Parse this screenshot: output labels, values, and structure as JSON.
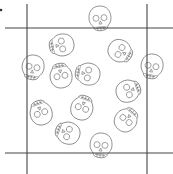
{
  "diagram": {
    "type": "repeating-tile-pattern",
    "motif": "skull-icon",
    "colors": {
      "line": "#444444",
      "skull_stroke": "#6a6a6a",
      "background": "#ffffff"
    },
    "crop_lines": {
      "vertical": [
        27,
        147
      ],
      "horizontal": [
        28,
        153
      ]
    },
    "corner_dot": {
      "x": 1,
      "y": 10
    },
    "skulls": [
      {
        "x": 100,
        "y": 18,
        "rot": -5
      },
      {
        "x": 62,
        "y": 45,
        "rot": 80
      },
      {
        "x": 120,
        "y": 51,
        "rot": -60
      },
      {
        "x": 33,
        "y": 67,
        "rot": 10
      },
      {
        "x": 152,
        "y": 66,
        "rot": 10
      },
      {
        "x": 61,
        "y": 76,
        "rot": 170
      },
      {
        "x": 88,
        "y": 74,
        "rot": 100
      },
      {
        "x": 128,
        "y": 91,
        "rot": -110
      },
      {
        "x": 82,
        "y": 108,
        "rot": -160
      },
      {
        "x": 41,
        "y": 113,
        "rot": 160
      },
      {
        "x": 126,
        "y": 120,
        "rot": -140
      },
      {
        "x": 68,
        "y": 133,
        "rot": 110
      },
      {
        "x": 101,
        "y": 145,
        "rot": 5
      }
    ]
  }
}
